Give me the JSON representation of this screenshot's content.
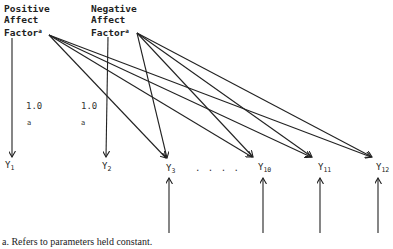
{
  "factors": {
    "positive": {
      "line1": "Positive",
      "line2": "Affect",
      "line3": "Factor",
      "sup": "a"
    },
    "negative": {
      "line1": "Negative",
      "line2": "Affect",
      "line3": "Factor",
      "sup": "a"
    }
  },
  "loadings": {
    "y1_value": "1.0",
    "y1_note": "a",
    "y2_value": "1.0",
    "y2_note": "a"
  },
  "variables": [
    {
      "base": "Y",
      "sub": "1"
    },
    {
      "base": "Y",
      "sub": "2"
    },
    {
      "base": "Y",
      "sub": "3"
    },
    {
      "base": "Y",
      "sub": "10"
    },
    {
      "base": "Y",
      "sub": "11"
    },
    {
      "base": "Y",
      "sub": "12"
    }
  ],
  "ellipsis": ". . . .",
  "footnote": "a. Refers to parameters held constant."
}
